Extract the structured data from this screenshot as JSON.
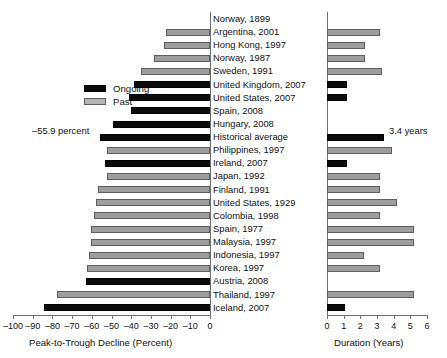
{
  "chart_data": {
    "type": "bar",
    "title": "",
    "orientation": "horizontal",
    "layout": "paired-panel",
    "grid": false,
    "legend": {
      "position": "left-upper",
      "entries": [
        {
          "label": "Ongoing",
          "color": "#0b0b0b",
          "key": "ongoing"
        },
        {
          "label": "Past",
          "color": "#b6b6b6",
          "key": "past"
        }
      ]
    },
    "panels": [
      {
        "key": "decline",
        "xlabel": "Peak-to-Trough Decline (Percent)",
        "xlim": [
          -100,
          0
        ],
        "ticks": [
          -100,
          -90,
          -80,
          -70,
          -60,
          -50,
          -40,
          -30,
          -20,
          -10,
          0
        ],
        "ticklabels": [
          "–100",
          "–90",
          "–80",
          "–70",
          "–60",
          "–50",
          "–40",
          "–30",
          "–20",
          "–10",
          "0"
        ]
      },
      {
        "key": "duration",
        "xlabel": "Duration  (Years)",
        "xlim": [
          0,
          6
        ],
        "ticks": [
          0,
          1,
          2,
          3,
          4,
          5,
          6
        ],
        "ticklabels": [
          "0",
          "1",
          "2",
          "3",
          "4",
          "5",
          "6"
        ]
      }
    ],
    "categories": [
      "Norway, 1899",
      "Argentina, 2001",
      "Hong Kong, 1997",
      "Norway, 1987",
      "Sweden, 1991",
      "United Kingdom, 2007",
      "United States, 2007",
      "Spain, 2008",
      "Hungary, 2008",
      "Historical average",
      "Philippines, 1997",
      "Ireland, 2007",
      "Japan, 1992",
      "Finland, 1991",
      "United States, 1929",
      "Colombia, 1998",
      "Spain, 1977",
      "Malaysia, 1997",
      "Indonesia, 1997",
      "Korea, 1997",
      "Austria, 2008",
      "Thailand, 1997",
      "Iceland, 2007"
    ],
    "status": [
      "past",
      "past",
      "past",
      "past",
      "past",
      "ongoing",
      "ongoing",
      "ongoing",
      "ongoing",
      "ongoing",
      "past",
      "ongoing",
      "past",
      "past",
      "past",
      "past",
      "past",
      "past",
      "past",
      "past",
      "ongoing",
      "past",
      "ongoing"
    ],
    "decline_percent": [
      0.0,
      -22.5,
      -23.5,
      -28.5,
      -35.0,
      -38.5,
      -41.0,
      -40.0,
      -49.0,
      -55.9,
      -52.5,
      -53.5,
      -52.5,
      -57.0,
      -58.0,
      -59.0,
      -60.5,
      -60.5,
      -61.5,
      -62.5,
      -63.0,
      -77.5,
      -84.5
    ],
    "duration_years": [
      0.0,
      3.2,
      2.3,
      2.3,
      3.3,
      1.2,
      1.2,
      0.0,
      0.0,
      3.4,
      3.9,
      1.2,
      3.2,
      3.2,
      4.2,
      3.2,
      5.2,
      5.2,
      2.2,
      3.2,
      0.0,
      5.2,
      1.1
    ],
    "annotations": [
      {
        "key": "historical-decline",
        "text": "–55.9 percent",
        "panel": "decline",
        "category": "Historical average"
      },
      {
        "key": "historical-duration",
        "text": "3.4 years",
        "panel": "duration",
        "category": "Historical average"
      }
    ]
  }
}
